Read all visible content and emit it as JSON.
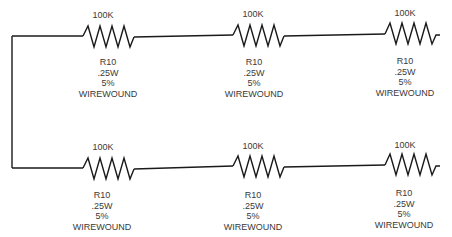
{
  "diagram": {
    "type": "circuit-schematic",
    "wire_color": "#1a1a1a",
    "text_color": "#3a3a3a",
    "resistors": [
      {
        "id": "r-top-1",
        "value": "100K",
        "ref": "R10",
        "power": ".25W",
        "tolerance": "5%",
        "type": "WIREWOUND"
      },
      {
        "id": "r-top-2",
        "value": "100K",
        "ref": "R10",
        "power": ".25W",
        "tolerance": "5%",
        "type": "WIREWOUND"
      },
      {
        "id": "r-top-3",
        "value": "100K",
        "ref": "R10",
        "power": ".25W",
        "tolerance": "5%",
        "type": "WIREWOUND"
      },
      {
        "id": "r-bot-1",
        "value": "100K",
        "ref": "R10",
        "power": ".25W",
        "tolerance": "5%",
        "type": "WIREWOUND"
      },
      {
        "id": "r-bot-2",
        "value": "100K",
        "ref": "R10",
        "power": ".25W",
        "tolerance": "5%",
        "type": "WIREWOUND"
      },
      {
        "id": "r-bot-3",
        "value": "100K",
        "ref": "R10",
        "power": ".25W",
        "tolerance": "5%",
        "type": "WIREWOUND"
      }
    ]
  }
}
